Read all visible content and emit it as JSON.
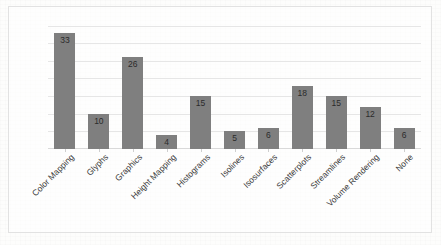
{
  "chart_data": {
    "type": "bar",
    "title": "",
    "xlabel": "",
    "ylabel": "",
    "categories": [
      "Color Mapping",
      "Glyphs",
      "Graphics",
      "Height Mapping",
      "Histograms",
      "Isolines",
      "Isosurfaces",
      "Scatterplots",
      "Streamlines",
      "Volume Rendering",
      "None"
    ],
    "values": [
      33,
      10,
      26,
      4,
      15,
      5,
      6,
      18,
      15,
      12,
      6
    ],
    "data_labels": [
      "33",
      "10",
      "26",
      "4",
      "15",
      "5",
      "6",
      "18",
      "15",
      "12",
      "6"
    ],
    "ylim": [
      0,
      36
    ],
    "grid": true,
    "gridline_values": [
      5,
      10,
      15,
      20,
      25,
      30,
      35
    ],
    "y_tick_labels_visible": false,
    "legend": false,
    "legend_position": "none",
    "series": [
      {
        "name": "Responses",
        "values": [
          33,
          10,
          26,
          4,
          15,
          5,
          6,
          18,
          15,
          12,
          6
        ]
      }
    ],
    "colors": {
      "bar": "#7f7f7f",
      "gridline": "#e6e6e6",
      "axis": "#d9d9d9",
      "label_text": "#3a3a3a",
      "value_text": "#2b2b2b",
      "plot_background": "#ffffff",
      "frame_border": "#e2e2e2"
    },
    "label_rotation_degrees": -45
  }
}
